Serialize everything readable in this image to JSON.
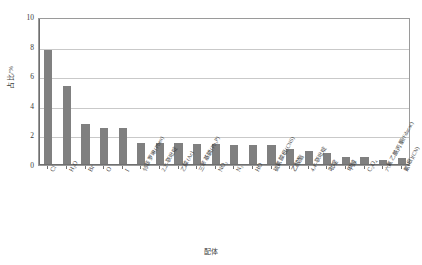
{
  "chart_data": {
    "type": "bar",
    "title": "",
    "xlabel": "配体",
    "ylabel": "占比/%",
    "ylim": [
      0,
      10
    ],
    "yticks": [
      0,
      2,
      4,
      6,
      8,
      10
    ],
    "ytick_labels": [
      "0",
      "2",
      "4",
      "6",
      "8",
      "10"
    ],
    "grid": true,
    "legend": false,
    "bar_color": "#808080",
    "categories": [
      "Cl",
      "H2O",
      "Br",
      "O",
      "I",
      "邻菲罗啉(Phen)",
      "2,2'-联吡啶",
      "乙酸(Ac)",
      "三苯基膦(Ph3P)",
      "NO3",
      "N3",
      "HO",
      "硫氰酸根(CNS)",
      "乙酸酯",
      "4,4'-联吡啶",
      "吡啶",
      "甲醇",
      "C2O4",
      "六氟乙酰丙酮(Fdacac)",
      "氰(根)(CN)"
    ],
    "values": [
      7.7,
      5.3,
      2.7,
      2.4,
      2.4,
      1.45,
      1.4,
      1.4,
      1.35,
      1.35,
      1.3,
      1.3,
      1.3,
      1.0,
      0.85,
      0.75,
      0.45,
      0.5,
      0.3,
      0.4
    ]
  },
  "axis": {
    "y_title": "占比/%",
    "x_title": "配体"
  }
}
